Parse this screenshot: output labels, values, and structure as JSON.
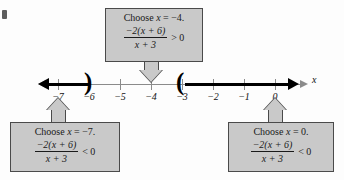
{
  "figure": {
    "type": "number-line-sign-chart",
    "axis_label": "x",
    "ticks": [
      {
        "value": "-7",
        "label": "−7",
        "x": 58
      },
      {
        "value": "-6",
        "label": "−6",
        "x": 89
      },
      {
        "value": "-5",
        "label": "−5",
        "x": 120
      },
      {
        "value": "-4",
        "label": "−4",
        "x": 151
      },
      {
        "value": "-3",
        "label": "−3",
        "x": 182
      },
      {
        "value": "-2",
        "label": "−2",
        "x": 213
      },
      {
        "value": "-1",
        "label": "−1",
        "x": 244
      },
      {
        "value": "0",
        "label": "0",
        "x": 275
      }
    ],
    "intervals": [
      {
        "name": "left-ray",
        "from": "-infinity",
        "to": "-6",
        "endpoint": "open",
        "bracket": ")"
      },
      {
        "name": "right-ray",
        "from": "-3",
        "to": "+infinity",
        "endpoint": "open",
        "bracket": "("
      }
    ]
  },
  "callouts": {
    "top": {
      "name": "test-point-minus-4",
      "headline_prefix": "Choose ",
      "headline_var": "x",
      "headline_eq": " = −4.",
      "numerator": "−2(x + 6)",
      "denominator": "x + 3",
      "relation": "> 0",
      "points_to": "-4"
    },
    "bottom_left": {
      "name": "test-point-minus-7",
      "headline_prefix": "Choose ",
      "headline_var": "x",
      "headline_eq": " = −7.",
      "numerator": "−2(x + 6)",
      "denominator": "x + 3",
      "relation": "< 0",
      "points_to": "-7"
    },
    "bottom_right": {
      "name": "test-point-zero",
      "headline_prefix": "Choose ",
      "headline_var": "x",
      "headline_eq": " = 0.",
      "numerator": "−2(x + 6)",
      "denominator": "x + 3",
      "relation": "< 0",
      "points_to": "0"
    }
  },
  "colors": {
    "callout_fill": "#c9c9c9",
    "callout_border": "#4a4a4a",
    "axis": "#8b8b8b",
    "solution_ray": "#000000",
    "page": "#fdfdfd"
  }
}
